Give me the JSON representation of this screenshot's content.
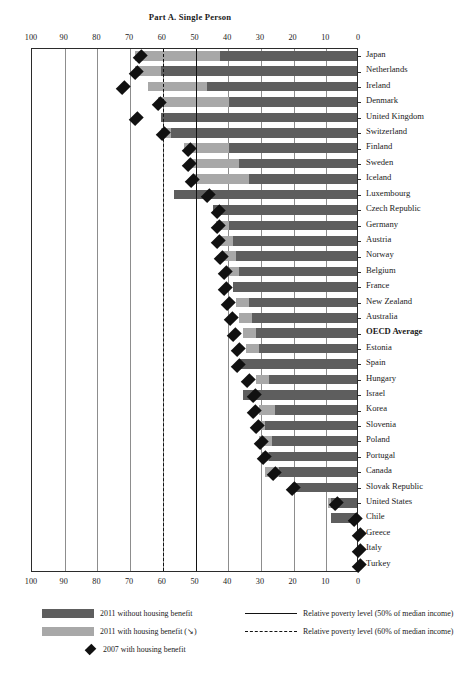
{
  "chart_data": {
    "type": "bar",
    "title": "Part A. Single Person",
    "xlabel": "",
    "ylabel": "",
    "orientation": "horizontal",
    "x_axis_reversed": true,
    "xlim": [
      0,
      100
    ],
    "xticks": [
      100,
      90,
      80,
      70,
      60,
      50,
      40,
      30,
      20,
      10,
      0
    ],
    "grid": true,
    "legend_position": "bottom",
    "categories": [
      "Japan",
      "Netherlands",
      "Ireland",
      "Denmark",
      "United Kingdom",
      "Switzerland",
      "Finland",
      "Sweden",
      "Iceland",
      "Luxembourg",
      "Czech Republic",
      "Germany",
      "Austria",
      "Norway",
      "Belgium",
      "France",
      "New Zealand",
      "Australia",
      "OECD Average",
      "Estonia",
      "Spain",
      "Hungary",
      "Israel",
      "Korea",
      "Slovenia",
      "Poland",
      "Portugal",
      "Canada",
      "Slovak Republic",
      "United States",
      "Chile",
      "Greece",
      "Italy",
      "Turkey"
    ],
    "highlight_category": "OECD Average",
    "series": [
      {
        "name": "2011 without housing benefit",
        "color": "#5e5e5e",
        "values": [
          42,
          60,
          46,
          39,
          60,
          57,
          39,
          36,
          33,
          56,
          44,
          39,
          38,
          37,
          36,
          38,
          33,
          32,
          31,
          30,
          36,
          27,
          35,
          25,
          28,
          26,
          27,
          24,
          19,
          8,
          8,
          0,
          0,
          0
        ]
      },
      {
        "name": "2011 with housing benefit",
        "color": "#a8a8a8",
        "values": [
          68,
          68,
          64,
          61,
          60,
          60,
          53,
          51,
          50,
          56,
          44,
          43,
          42,
          41,
          39,
          38,
          37,
          36,
          35,
          34,
          36,
          31,
          35,
          30,
          30,
          30,
          29,
          28,
          20,
          9,
          8,
          0,
          0,
          0
        ]
      }
    ],
    "markers": {
      "name": "2007 with housing benefit",
      "color": "#111111",
      "values": [
        67,
        68,
        72,
        61,
        68,
        60,
        52,
        52,
        51,
        46,
        43,
        43,
        43,
        42,
        41,
        41,
        40,
        39,
        38,
        37,
        37,
        34,
        32,
        32,
        31,
        30,
        29,
        26,
        20,
        7,
        1,
        0,
        0,
        0
      ]
    },
    "reference_lines": [
      {
        "label": "Relative poverty level (50% of median income)",
        "value": 50,
        "style": "solid"
      },
      {
        "label": "Relative poverty level (60% of median income)",
        "value": 60,
        "style": "dashed"
      }
    ]
  },
  "legend": {
    "items": [
      {
        "label": "2011 without housing benefit",
        "swatch": "dark"
      },
      {
        "label": "2011 with housing benefit (↘)",
        "swatch": "light"
      },
      {
        "label": "2007 with housing benefit",
        "swatch": "diamond"
      }
    ],
    "lines": [
      {
        "label": "Relative poverty level (50% of median income)",
        "style": "solid"
      },
      {
        "label": "Relative poverty level (60% of median income)",
        "style": "dashed"
      }
    ]
  }
}
